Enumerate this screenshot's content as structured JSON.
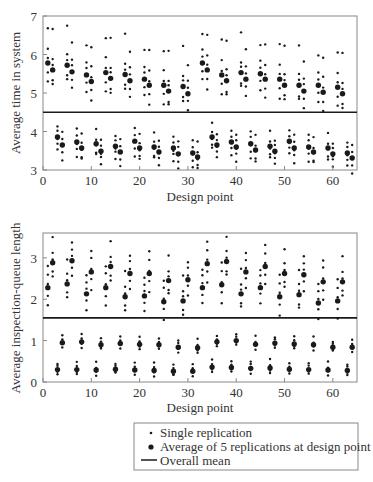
{
  "chart_data": [
    {
      "type": "scatter",
      "title": "",
      "xlabel": "Design point",
      "ylabel": "Average time in system",
      "xlim": [
        0,
        65
      ],
      "ylim": [
        3,
        7
      ],
      "xticks": [
        0,
        10,
        20,
        30,
        40,
        50,
        60
      ],
      "yticks": [
        3,
        4,
        5,
        6,
        7
      ],
      "grid": false,
      "overall_mean": 4.5,
      "series": [
        {
          "name": "Average of 5 replications at design point",
          "marker": "large-dot",
          "points": [
            [
              1,
              5.78
            ],
            [
              2,
              5.6
            ],
            [
              3,
              3.86
            ],
            [
              4,
              3.65
            ],
            [
              5,
              5.72
            ],
            [
              6,
              5.55
            ],
            [
              7,
              3.73
            ],
            [
              8,
              3.57
            ],
            [
              9,
              5.47
            ],
            [
              10,
              5.3
            ],
            [
              11,
              3.68
            ],
            [
              12,
              3.49
            ],
            [
              13,
              5.53
            ],
            [
              14,
              5.38
            ],
            [
              15,
              3.62
            ],
            [
              16,
              3.47
            ],
            [
              17,
              5.48
            ],
            [
              18,
              5.32
            ],
            [
              19,
              3.75
            ],
            [
              20,
              3.57
            ],
            [
              21,
              5.36
            ],
            [
              22,
              5.2
            ],
            [
              23,
              3.6
            ],
            [
              24,
              3.47
            ],
            [
              25,
              5.2
            ],
            [
              26,
              5.05
            ],
            [
              27,
              3.57
            ],
            [
              28,
              3.42
            ],
            [
              29,
              5.17
            ],
            [
              30,
              4.98
            ],
            [
              31,
              3.44
            ],
            [
              32,
              3.34
            ],
            [
              33,
              5.78
            ],
            [
              34,
              5.6
            ],
            [
              35,
              3.86
            ],
            [
              36,
              3.65
            ],
            [
              37,
              5.47
            ],
            [
              38,
              5.32
            ],
            [
              39,
              3.73
            ],
            [
              40,
              3.6
            ],
            [
              41,
              5.53
            ],
            [
              42,
              5.36
            ],
            [
              43,
              3.68
            ],
            [
              44,
              3.52
            ],
            [
              45,
              5.5
            ],
            [
              46,
              5.36
            ],
            [
              47,
              3.62
            ],
            [
              48,
              3.49
            ],
            [
              49,
              5.36
            ],
            [
              50,
              5.2
            ],
            [
              51,
              3.75
            ],
            [
              52,
              3.57
            ],
            [
              53,
              5.2
            ],
            [
              54,
              5.05
            ],
            [
              55,
              3.6
            ],
            [
              56,
              3.47
            ],
            [
              57,
              5.2
            ],
            [
              58,
              5.02
            ],
            [
              59,
              3.57
            ],
            [
              60,
              3.42
            ],
            [
              61,
              5.15
            ],
            [
              62,
              4.98
            ],
            [
              63,
              3.44
            ],
            [
              64,
              3.31
            ]
          ]
        },
        {
          "name": "Single replication",
          "marker": "small-dot",
          "spread": [
            0.95,
            0.35,
            0.15,
            -0.25,
            -0.45
          ],
          "spread_low_cluster": [
            0.35,
            0.15,
            -0.05,
            -0.2,
            -0.35
          ]
        },
        {
          "name": "Overall mean",
          "marker": "line",
          "value": 4.5
        }
      ]
    },
    {
      "type": "scatter",
      "title": "",
      "xlabel": "Design point",
      "ylabel": "Average inspection-queue length",
      "xlim": [
        0,
        65
      ],
      "ylim": [
        0,
        3.6
      ],
      "xticks": [
        0,
        10,
        20,
        30,
        40,
        50,
        60
      ],
      "yticks": [
        0,
        1,
        2,
        3
      ],
      "grid": false,
      "overall_mean": 1.55,
      "series": [
        {
          "name": "Average of 5 replications at design point",
          "marker": "large-dot",
          "points": [
            [
              1,
              2.28
            ],
            [
              2,
              2.88
            ],
            [
              3,
              0.3
            ],
            [
              4,
              0.95
            ],
            [
              5,
              2.37
            ],
            [
              6,
              2.93
            ],
            [
              7,
              0.3
            ],
            [
              8,
              0.97
            ],
            [
              9,
              2.13
            ],
            [
              10,
              2.66
            ],
            [
              11,
              0.29
            ],
            [
              12,
              0.9
            ],
            [
              13,
              2.28
            ],
            [
              14,
              2.79
            ],
            [
              15,
              0.31
            ],
            [
              16,
              0.93
            ],
            [
              17,
              2.06
            ],
            [
              18,
              2.62
            ],
            [
              19,
              0.29
            ],
            [
              20,
              0.91
            ],
            [
              21,
              2.08
            ],
            [
              22,
              2.62
            ],
            [
              23,
              0.28
            ],
            [
              24,
              0.9
            ],
            [
              25,
              1.94
            ],
            [
              26,
              2.45
            ],
            [
              27,
              0.26
            ],
            [
              28,
              0.84
            ],
            [
              29,
              1.96
            ],
            [
              30,
              2.47
            ],
            [
              31,
              0.26
            ],
            [
              32,
              0.83
            ],
            [
              33,
              2.28
            ],
            [
              34,
              2.86
            ],
            [
              35,
              0.36
            ],
            [
              36,
              0.97
            ],
            [
              37,
              2.35
            ],
            [
              38,
              2.91
            ],
            [
              39,
              0.35
            ],
            [
              40,
              1.0
            ],
            [
              41,
              2.13
            ],
            [
              42,
              2.66
            ],
            [
              43,
              0.33
            ],
            [
              44,
              0.91
            ],
            [
              45,
              2.28
            ],
            [
              46,
              2.79
            ],
            [
              47,
              0.34
            ],
            [
              48,
              0.94
            ],
            [
              49,
              2.06
            ],
            [
              50,
              2.62
            ],
            [
              51,
              0.31
            ],
            [
              52,
              0.92
            ],
            [
              53,
              2.11
            ],
            [
              54,
              2.59
            ],
            [
              55,
              0.3
            ],
            [
              56,
              0.9
            ],
            [
              57,
              1.91
            ],
            [
              58,
              2.42
            ],
            [
              59,
              0.29
            ],
            [
              60,
              0.84
            ],
            [
              61,
              1.96
            ],
            [
              62,
              2.42
            ],
            [
              63,
              0.28
            ],
            [
              64,
              0.84
            ]
          ]
        },
        {
          "name": "Single replication",
          "marker": "small-dot",
          "spread": [
            0.55,
            0.3,
            0.1,
            -0.2,
            -0.4
          ],
          "spread_low_cluster": [
            0.18,
            0.08,
            -0.05,
            -0.12
          ]
        },
        {
          "name": "Overall mean",
          "marker": "line",
          "value": 1.55
        }
      ]
    }
  ],
  "legend": {
    "items": [
      {
        "marker": "small-dot",
        "label": "Single replication"
      },
      {
        "marker": "large-dot",
        "label": "Average of 5 replications at design point"
      },
      {
        "marker": "line",
        "label": "Overall mean"
      }
    ]
  },
  "colors": {
    "ink": "#1a1a1a",
    "axis": "#555555",
    "background": "#ffffff"
  }
}
